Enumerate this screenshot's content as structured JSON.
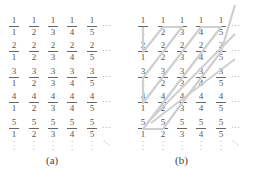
{
  "figure": {
    "panels": [
      {
        "id": "a",
        "caption": "(a)",
        "rows": [
          [
            {
              "n": "1",
              "d": "1"
            },
            {
              "n": "1",
              "d": "2"
            },
            {
              "n": "1",
              "d": "3"
            },
            {
              "n": "1",
              "d": "4"
            },
            {
              "n": "1",
              "d": "5"
            }
          ],
          [
            {
              "n": "2",
              "d": "1"
            },
            {
              "n": "2",
              "d": "2"
            },
            {
              "n": "2",
              "d": "3"
            },
            {
              "n": "2",
              "d": "4"
            },
            {
              "n": "2",
              "d": "5"
            }
          ],
          [
            {
              "n": "3",
              "d": "1"
            },
            {
              "n": "3",
              "d": "2"
            },
            {
              "n": "3",
              "d": "3"
            },
            {
              "n": "3",
              "d": "4"
            },
            {
              "n": "3",
              "d": "5"
            }
          ],
          [
            {
              "n": "4",
              "d": "1"
            },
            {
              "n": "4",
              "d": "2"
            },
            {
              "n": "4",
              "d": "3"
            },
            {
              "n": "4",
              "d": "4"
            },
            {
              "n": "4",
              "d": "5"
            }
          ],
          [
            {
              "n": "5",
              "d": "1"
            },
            {
              "n": "5",
              "d": "2"
            },
            {
              "n": "5",
              "d": "3"
            },
            {
              "n": "5",
              "d": "4"
            },
            {
              "n": "5",
              "d": "5"
            }
          ]
        ],
        "row_ellipsis": "···",
        "col_ellipsis": "⋮",
        "diag_ellipsis": "⋱"
      },
      {
        "id": "b",
        "caption": "(b)",
        "rows": [
          [
            {
              "n": "1",
              "d": "1"
            },
            {
              "n": "1",
              "d": "2"
            },
            {
              "n": "1",
              "d": "3"
            },
            {
              "n": "1",
              "d": "4"
            },
            {
              "n": "1",
              "d": "5"
            }
          ],
          [
            {
              "n": "2",
              "d": "1"
            },
            {
              "n": "2",
              "d": "2"
            },
            {
              "n": "2",
              "d": "3"
            },
            {
              "n": "2",
              "d": "4"
            },
            {
              "n": "2",
              "d": "5"
            }
          ],
          [
            {
              "n": "3",
              "d": "1"
            },
            {
              "n": "3",
              "d": "2"
            },
            {
              "n": "3",
              "d": "3"
            },
            {
              "n": "3",
              "d": "4"
            },
            {
              "n": "3",
              "d": "5"
            }
          ],
          [
            {
              "n": "4",
              "d": "1"
            },
            {
              "n": "4",
              "d": "2"
            },
            {
              "n": "4",
              "d": "3"
            },
            {
              "n": "4",
              "d": "4"
            },
            {
              "n": "4",
              "d": "5"
            }
          ],
          [
            {
              "n": "5",
              "d": "1"
            },
            {
              "n": "5",
              "d": "2"
            },
            {
              "n": "5",
              "d": "3"
            },
            {
              "n": "5",
              "d": "4"
            },
            {
              "n": "5",
              "d": "5"
            }
          ]
        ],
        "row_ellipsis": "···",
        "col_ellipsis": "⋮",
        "diag_ellipsis": "⋱",
        "enumeration_path": [
          [
            0,
            0
          ],
          [
            1,
            0
          ],
          [
            0,
            1
          ],
          [
            0,
            2
          ],
          [
            2,
            0
          ],
          [
            3,
            0
          ],
          [
            0,
            3
          ],
          [
            0,
            4
          ],
          [
            4,
            0
          ],
          [
            4,
            1
          ],
          [
            3,
            2
          ],
          [
            2,
            3
          ],
          [
            1,
            4
          ],
          [
            0,
            5
          ]
        ],
        "path_color": "#cfcfcf"
      }
    ]
  }
}
